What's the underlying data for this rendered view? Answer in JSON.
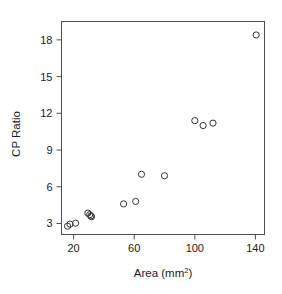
{
  "chart_data": {
    "type": "scatter",
    "title": "",
    "xlabel": "Area (mm2)",
    "xlabel_base": "Area (mm",
    "xlabel_sup": "2",
    "xlabel_close": ")",
    "ylabel": "CP Ratio",
    "xlim": [
      12,
      146
    ],
    "ylim": [
      2.1,
      19.5
    ],
    "xticks": [
      20,
      60,
      100,
      140
    ],
    "xtick_labels": [
      "20",
      "60",
      "100",
      "140"
    ],
    "yticks": [
      3,
      6,
      9,
      12,
      15,
      18
    ],
    "ytick_labels": [
      "3",
      "6",
      "9",
      "12",
      "15",
      "18"
    ],
    "grid": false,
    "legend": null,
    "marker": "open-circle",
    "marker_color": "#333333",
    "marker_size": 3.1,
    "x": [
      16.0,
      17.6,
      21.3,
      29.4,
      30.6,
      31.4,
      31.8,
      53.0,
      61.0,
      64.8,
      80.0,
      100.0,
      105.5,
      112.0,
      140.5
    ],
    "y": [
      2.78,
      2.95,
      3.02,
      3.85,
      3.72,
      3.62,
      3.55,
      4.6,
      4.8,
      7.02,
      6.9,
      11.4,
      11.0,
      11.2,
      18.4
    ],
    "n_points": 15
  },
  "figure": {
    "background": "#ffffff",
    "frame_color": "#4d4d4d",
    "text_color": "#1a1a1a"
  }
}
